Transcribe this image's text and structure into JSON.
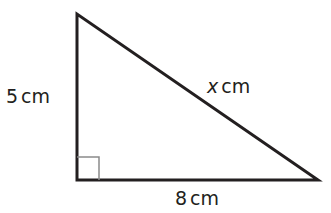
{
  "diagram": {
    "type": "right-triangle",
    "vertices": {
      "top": [
        77,
        14
      ],
      "bottom_left": [
        77,
        180
      ],
      "bottom_right": [
        318,
        180
      ]
    },
    "right_angle_at": "bottom_left",
    "labels": {
      "vertical_side": {
        "value": "5",
        "unit": "cm"
      },
      "horizontal_side": {
        "value": "8",
        "unit": "cm"
      },
      "hypotenuse": {
        "value": "x",
        "unit": "cm"
      }
    },
    "stroke_color": "#231f20",
    "marker_color": "#8a8a8a"
  }
}
